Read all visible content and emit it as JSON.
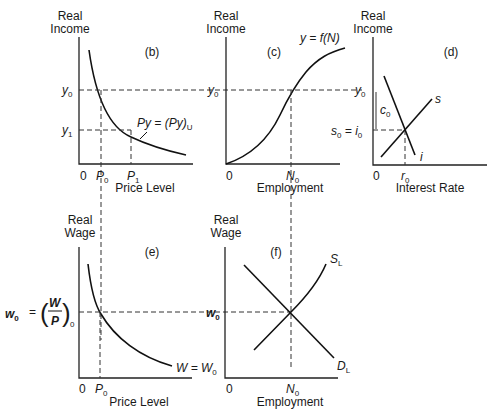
{
  "panels": {
    "b": {
      "tag": "(b)",
      "y_label": [
        "Real",
        "Income"
      ],
      "x_label": "Price Level",
      "origin": "0",
      "ticks_y": [
        "y",
        "y"
      ],
      "ticks_y_sub": [
        "0",
        "1"
      ],
      "ticks_x": [
        "P",
        "P"
      ],
      "ticks_x_sub": [
        "0",
        "1"
      ],
      "curve_label": "Py = (Py)",
      "curve_label_sub": "U"
    },
    "c": {
      "tag": "(c)",
      "y_label": [
        "Real",
        "Income"
      ],
      "x_label": "Employment",
      "origin": "0",
      "tick_y": "y",
      "tick_y_sub": "0",
      "tick_x": "N",
      "tick_x_sub": "0",
      "curve_label": "y = f(N)"
    },
    "d": {
      "tag": "(d)",
      "y_label": [
        "Real",
        "Income"
      ],
      "x_label": "Interest Rate",
      "origin": "0",
      "tick_y_top": "y",
      "tick_y_top_sub": "0",
      "tick_y_mid": "s",
      "tick_y_mid_sub": "0",
      "tick_y_mid_eq": " = i",
      "tick_y_mid_eq_sub": "0",
      "bracket": "c",
      "bracket_sub": "0",
      "tick_x": "r",
      "tick_x_sub": "0",
      "line_s": "s",
      "line_i": "i"
    },
    "e": {
      "tag": "(e)",
      "y_label": [
        "Real",
        "Wage"
      ],
      "x_label": "Price Level",
      "origin": "0",
      "tick_y": "w",
      "tick_y_sub": "0",
      "tick_y_eq": "=",
      "frac_num": "W",
      "frac_den": "P",
      "frac_sub": "0",
      "tick_x": "P",
      "tick_x_sub": "0",
      "curve_label": "W = W",
      "curve_label_sub": "0"
    },
    "f": {
      "tag": "(f)",
      "y_label": [
        "Real",
        "Wage"
      ],
      "x_label": "Employment",
      "origin": "0",
      "tick_y": "w",
      "tick_y_sub": "0",
      "tick_x": "N",
      "tick_x_sub": "0",
      "supply": "S",
      "supply_sub": "L",
      "demand": "D",
      "demand_sub": "L"
    }
  }
}
